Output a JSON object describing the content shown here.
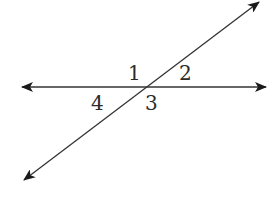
{
  "diagram": {
    "type": "intersecting-lines",
    "line_color": "#333333",
    "lines": [
      {
        "name": "horizontal-line",
        "x1": 22,
        "y1": 87,
        "x2": 266,
        "y2": 87
      },
      {
        "name": "transversal-line",
        "x1": 24,
        "y1": 180,
        "x2": 259,
        "y2": 2
      }
    ],
    "intersection": {
      "x": 143,
      "y": 87
    },
    "angles": [
      {
        "label": "1",
        "x": 128,
        "y": 80
      },
      {
        "label": "2",
        "x": 179,
        "y": 80
      },
      {
        "label": "3",
        "x": 145,
        "y": 110
      },
      {
        "label": "4",
        "x": 91,
        "y": 110
      }
    ]
  }
}
